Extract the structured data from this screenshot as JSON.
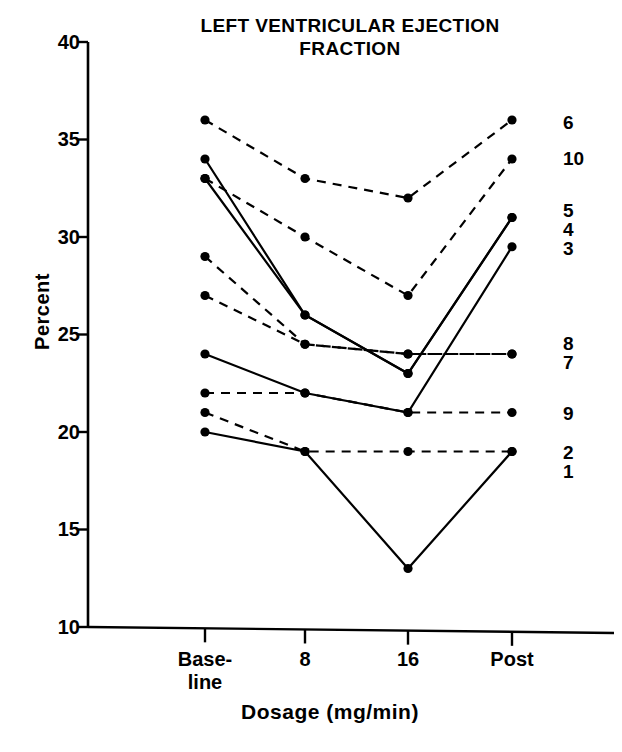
{
  "chart_data": {
    "type": "line",
    "title": "LEFT VENTRICULAR EJECTION FRACTION",
    "xlabel": "Dosage (mg/min)",
    "ylabel": "Percent",
    "categories": [
      "Base-\nline",
      "8",
      "16",
      "Post"
    ],
    "x_tick_labels": [
      "Base-",
      "line",
      "8",
      "16",
      "Post"
    ],
    "ylim": [
      10,
      40
    ],
    "y_ticks": [
      10,
      15,
      20,
      25,
      30,
      35,
      40
    ],
    "y_tick_labels": [
      "10",
      "15",
      "20",
      "25",
      "30",
      "35",
      "40"
    ],
    "grid": false,
    "legend": "inline-right-end-labels",
    "series": [
      {
        "name": "1",
        "label": "1",
        "style": "solid",
        "values": [
          20,
          19,
          13,
          19
        ]
      },
      {
        "name": "2",
        "label": "2",
        "style": "dashed",
        "values": [
          21,
          19,
          19,
          19
        ]
      },
      {
        "name": "3",
        "label": "3",
        "style": "solid",
        "values": [
          24,
          22,
          21,
          29.5
        ]
      },
      {
        "name": "4",
        "label": "4",
        "style": "solid",
        "values": [
          34,
          26,
          23,
          31
        ]
      },
      {
        "name": "5",
        "label": "5",
        "style": "solid",
        "values": [
          33,
          26,
          23,
          31
        ]
      },
      {
        "name": "6",
        "label": "6",
        "style": "dashed",
        "values": [
          36,
          33,
          32,
          36
        ]
      },
      {
        "name": "7",
        "label": "7",
        "style": "dashed",
        "values": [
          27,
          24.5,
          24,
          24
        ]
      },
      {
        "name": "8",
        "label": "8",
        "style": "dashed",
        "values": [
          29,
          24.5,
          24,
          24
        ]
      },
      {
        "name": "9",
        "label": "9",
        "style": "dashed",
        "values": [
          22,
          22,
          21,
          21
        ]
      },
      {
        "name": "10",
        "label": "10",
        "style": "dashed",
        "values": [
          33,
          30,
          27,
          34
        ]
      }
    ]
  },
  "axis": {
    "y_axis_name": "Percent",
    "x_axis_name": "Dosage (mg/min)"
  }
}
